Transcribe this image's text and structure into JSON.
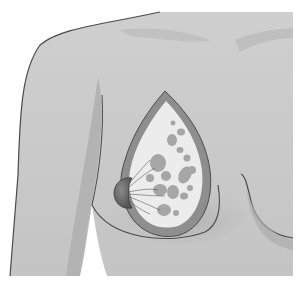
{
  "illustration": {
    "subject": "Female torso with cross-section of left breast showing internal tissue",
    "alt": "Medical illustration of breast anatomy cross-section",
    "colors": {
      "background": "#ffffff",
      "skin": "#c9c9c9",
      "skin_light": "#d6d6d6",
      "skin_shadow": "#a9a9a9",
      "outline": "#4a4a4a",
      "tissue_rim": "#8e8e8e",
      "fatty_tissue": "#ececec",
      "lobules": "#9a9a9a",
      "nipple": "#6e6e6e"
    },
    "parts": [
      "shoulder",
      "torso",
      "arm",
      "breast-cross-section",
      "fatty-tissue",
      "lobules",
      "milk-ducts",
      "nipple-areola",
      "right-breast-outline"
    ]
  }
}
